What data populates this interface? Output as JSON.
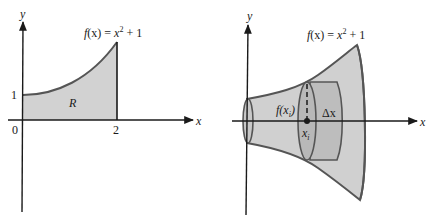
{
  "left_panel": {
    "title": "Region R under curve",
    "function_label": "f(x) = x² + 1",
    "function_label_parts": {
      "f": "f",
      "x_in": "(x) = ",
      "x": "x",
      "exp": "2",
      "rest": " + 1"
    },
    "axis_x_label": "x",
    "axis_y_label": "y",
    "region_label": "R",
    "tick_y_1": "1",
    "origin_label": "0",
    "tick_x_2": "2"
  },
  "right_panel": {
    "title": "Solid of revolution",
    "function_label_parts": {
      "f": "f",
      "x_in": "(x) = ",
      "x": "x",
      "exp": "2",
      "rest": " + 1"
    },
    "axis_x_label": "x",
    "axis_y_label": "y",
    "radius_label": "f(x",
    "radius_sub": "i",
    "radius_close": ")",
    "sample_point_label": "x",
    "sample_point_sub": "i",
    "thickness_label": "Δx"
  },
  "colors": {
    "fill_region": "#d2d2d2",
    "fill_solid": "#d0d0d0",
    "fill_disk": "#b8b8b8",
    "curve_stroke": "#555555",
    "axis": "#1a1a1a",
    "background": "#ffffff"
  }
}
